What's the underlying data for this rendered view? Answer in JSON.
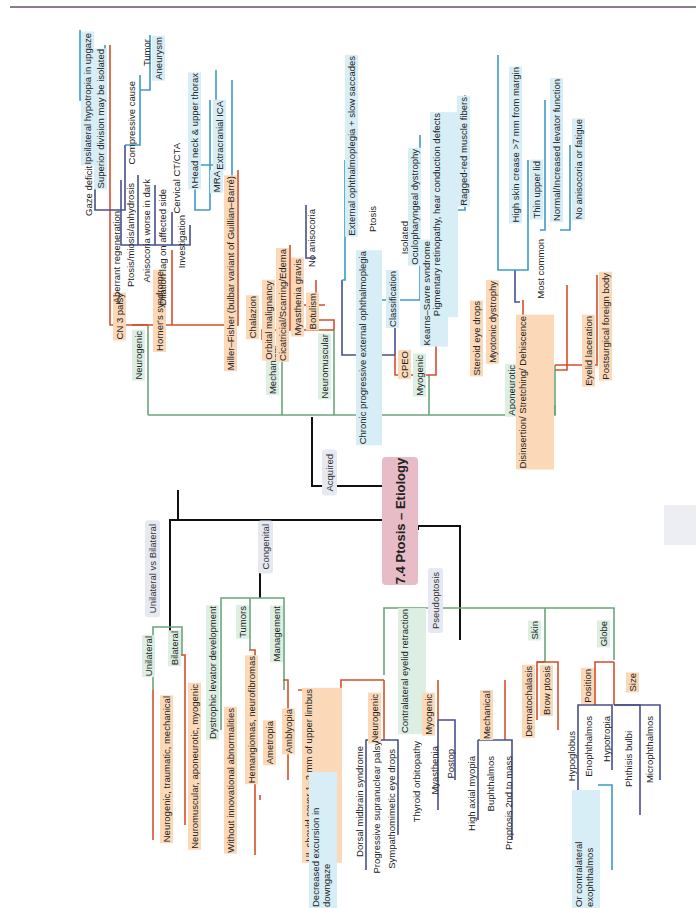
{
  "title": "7.4 Ptosis – Etiology",
  "colors": {
    "green": "#6aa57a",
    "orange": "#d4502a",
    "navy": "#4a4f8c",
    "blue": "#3d9ac8",
    "black": "#111111",
    "title_bg": "#e7bcc6",
    "orange_bg": "#fbd9b8",
    "blue_bg": "#d8eef6",
    "green_bg": "#dcefe2",
    "grey_bg": "#e6e9f2"
  },
  "main_branches": {
    "acquired": "Acquired",
    "congenital": "Congenital",
    "unilateral_vs_bilateral": "Unilateral vs Bilateral",
    "pseudoptosis": "Pseudoptosis"
  },
  "acquired": {
    "neurogenic": {
      "label": "Neurogenic",
      "cn3": {
        "label": "CN 3 palsy",
        "gaze": "Gaze deficits",
        "ipsi": "Ipsilateral hypotropia in upgaze",
        "superior": "Superior division may be isolated",
        "aberrant": "Aberrant regeneration",
        "compressive": "Compressive cause",
        "tumor": "Tumor",
        "aneurysm": "Aneurysm"
      },
      "horner": {
        "label": "Horner's syndrome",
        "ptosis": "Ptosis/miosis/anhydrosis",
        "aniso": "Anisocoria worse in dark",
        "dilation": "Dilation lag on affected side",
        "investigation": "Investigation",
        "ct": "Cervical CT/CTA",
        "mri": "MRI",
        "head": "Head neck & upper thorax",
        "mra": "MRA",
        "ica": "Extracranial ICA"
      },
      "miller": "Miller–Fisher (bulbar variant of Guillian–Barré)"
    },
    "mechanical": {
      "label": "Mechanical",
      "chalazion": "Chalazion",
      "orbital": "Orbital malignancy",
      "cicatricial": "Cicatricial/Scarring/Edema"
    },
    "neuromuscular": {
      "label": "Neuromuscular",
      "mg": "Myasthenia gravis",
      "noaniso": "No anisocoria",
      "botulism": "Botulism"
    },
    "myogenic": {
      "label": "Myogenic",
      "cpeo": {
        "label": "CPEO",
        "full": "Chronic progressive external ophthalmoplegia",
        "ptosis": "Ptosis",
        "ext": "External ophthalmoplegia + slow saccades",
        "classification": "Classification",
        "isolated": "Isolated",
        "opd": "Oculopharyngeal dystrophy",
        "kss": "Kearns–Sayre syndrome",
        "pigment": "Pigmentary retinopathy, hear conduction defects",
        "ragged": "Ragged-red muscle fibers"
      },
      "steroid": "Steroid eye drops",
      "myotonic": "Myotonic dystrophy"
    },
    "aponeurotic": {
      "label": "Aponeurotic",
      "dis": "Disinsertion/ Stretching/ Dehiscence",
      "most": "Most common",
      "crease": "High skin crease >7 mm from margin",
      "thin": "Thin upper lid",
      "normal": "Normal/Increased levator function",
      "noaniso": "No anisocoria or fatigue"
    },
    "traumatic": {
      "label": "Traumatic",
      "lac": "Eyelid laceration",
      "fb": "Postsurgical foreign body"
    }
  },
  "unilateral_bilateral": {
    "unilateral": "Unilateral",
    "uni_causes": "Neurogenic, traumatic, mechanical",
    "bilateral": "Bilateral",
    "bi_causes": "Neuromuscular, aponeurotic, myogenic"
  },
  "congenital": {
    "dystrophic": "Dystrophic levator development",
    "without": "Without innovational abnormalities",
    "tumors": "Tumors",
    "hem": "Hemangiomas, neurofibromas",
    "management": "Management",
    "ametropia": "Ametropia",
    "amblyopia": "Amblyopia",
    "ul": "UL should cover 1–2 mm of upper limbus"
  },
  "pseudoptosis": {
    "contra": "Contralateral eyelid retraction",
    "dec": "Decreased excursion in downgaze",
    "neurogenic": "Neurogenic",
    "dorsal": "Dorsal midbrain syndrome",
    "psp": "Progressive supranuclear palsy",
    "sympath": "Sympathomimetic eye drops",
    "myogenic": "Myogenic",
    "thyroid": "Thyroid orbitopathy",
    "myasthenia": "Myasthenia",
    "postop": "Postop",
    "mechanical": "Mechanical",
    "axial": "High axial myopia",
    "buph": "Buphthalmos",
    "proptosis": "Proptosis 2nd to mass",
    "skin": "Skin",
    "dermato": "Dermatochalasis",
    "brow": "Brow ptosis",
    "globe": "Globe",
    "position": "Position",
    "hypoglobus": "Hypoglobus",
    "enoph": "Enophthalmos",
    "hypotropia": "Hypotropia",
    "orcontra": "Or contralateral exophthalmos",
    "size": "Size",
    "phthisis": "Phthisis bulbi",
    "micro": "Microphthalmos"
  }
}
